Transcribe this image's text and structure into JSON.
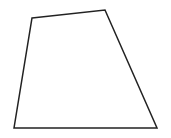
{
  "figure": {
    "width": 171,
    "height": 138,
    "background": "#ffffff",
    "shape": {
      "type": "quadrilateral",
      "stroke": "#222222",
      "stroke_width": 1.5,
      "fill": "none",
      "vertices": [
        [
          32,
          18
        ],
        [
          105,
          10
        ],
        [
          157,
          128
        ],
        [
          14,
          128
        ]
      ],
      "points": "32,18 105,10 157,128 14,128"
    }
  }
}
